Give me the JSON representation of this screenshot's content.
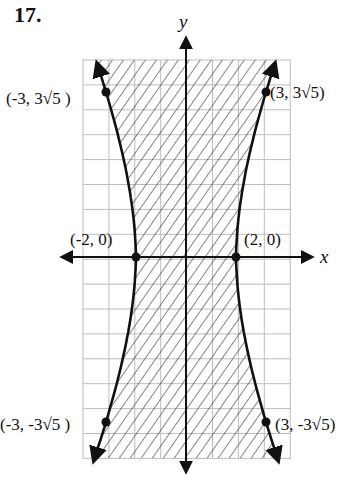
{
  "problem": {
    "number": "17."
  },
  "chart_data": {
    "type": "line",
    "title": "",
    "xlabel": "x",
    "ylabel": "y",
    "grid": true,
    "hyperbola": {
      "a2": 4,
      "b2": 36,
      "orientation": "horizontal",
      "boundary": "solid",
      "shaded_region": "between branches"
    },
    "points": [
      {
        "label": "(-3, 3√5)",
        "x": -3,
        "y": 6.708
      },
      {
        "label": "(3, 3√5)",
        "x": 3,
        "y": 6.708
      },
      {
        "label": "(-2, 0)",
        "x": -2,
        "y": 0
      },
      {
        "label": "(2, 0)",
        "x": 2,
        "y": 0
      },
      {
        "label": "(-3, -3√5)",
        "x": -3,
        "y": -6.708
      },
      {
        "label": "(3, -3√5)",
        "x": 3,
        "y": -6.708
      }
    ],
    "xlim": [
      -4.1,
      4.2
    ],
    "ylim": [
      -8.0,
      7.9
    ]
  },
  "labels": {
    "tl": "(-3, 3√5 )",
    "tr": "(3, 3√5)",
    "ml": "(-2, 0)",
    "mr": "(2, 0)",
    "bl": "(-3, -3√5 )",
    "br": "(3, -3√5)",
    "x_axis": "x",
    "y_axis": "y"
  }
}
